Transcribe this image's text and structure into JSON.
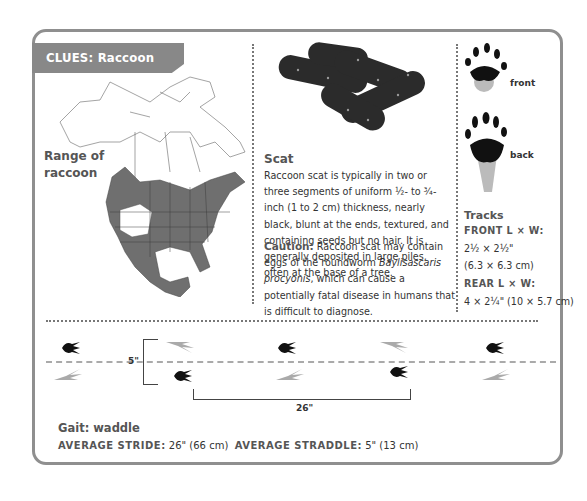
{
  "header": {
    "title": "CLUES: Raccoon"
  },
  "map": {
    "label": "Range of raccoon",
    "label_line1": "Range of",
    "label_line2": "raccoon",
    "range_color": "#6f6f6f"
  },
  "scat": {
    "title": "Scat",
    "description": "Raccoon scat is typically in two or three segments of uniform ½- to ¾-inch (1 to 2 cm) thickness, nearly black, blunt at the ends, textured, and containing seeds but no hair. It is generally deposited in large piles, often at the base of a tree.",
    "caution_label": "Caution:",
    "caution_text_1": " Raccoon scat may contain eggs of the roundworm ",
    "caution_species": "Baylisascaris procyonis",
    "caution_text_2": ", which can cause a potentially fatal disease in humans that is difficult to diagnose."
  },
  "tracks": {
    "front_label": "front",
    "back_label": "back",
    "title": "Tracks",
    "front_heading": "FRONT L × W:",
    "front_size_in": "2½ × 2½\"",
    "front_size_cm": "(6.3 × 6.3 cm)",
    "rear_heading": "REAR L × W:",
    "rear_size": "4 × 2¼\" (10 × 5.7 cm)"
  },
  "gait_diagram": {
    "straddle_label": "5\"",
    "stride_label": "26\""
  },
  "gait": {
    "title": "Gait: waddle",
    "stride_label": "AVERAGE STRIDE:",
    "stride_value": " 26\" (66 cm)",
    "straddle_label": "AVERAGE STRADDLE:",
    "straddle_value": " 5\" (13 cm)"
  }
}
